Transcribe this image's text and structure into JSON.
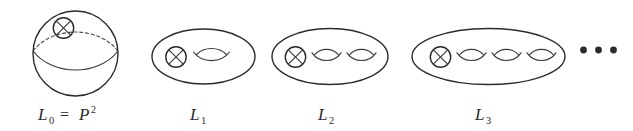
{
  "figure": {
    "kind": "mathematical-diagram",
    "background_color": "#ffffff",
    "ink_color": "#2b2b2b",
    "ellipsis": "• • •",
    "ellipsis_dot_count": 3,
    "surfaces": [
      {
        "id": "L0",
        "shape": "sphere",
        "label_main": "L",
        "label_subscript": "0",
        "label_equals": "=",
        "label_rhs_base": "P",
        "label_rhs_superscript": "2",
        "label_plain": "L₀ = P²",
        "crosscaps": 1,
        "handles": 0,
        "has_equator": true,
        "equator_back_style": "dashed",
        "equator_front_style": "solid"
      },
      {
        "id": "L1",
        "shape": "ellipse",
        "label_main": "L",
        "label_subscript": "1",
        "label_plain": "L₁",
        "crosscaps": 1,
        "handles": 1,
        "has_equator": false
      },
      {
        "id": "L2",
        "shape": "ellipse",
        "label_main": "L",
        "label_subscript": "2",
        "label_plain": "L₂",
        "crosscaps": 1,
        "handles": 2,
        "has_equator": false
      },
      {
        "id": "L3",
        "shape": "ellipse",
        "label_main": "L",
        "label_subscript": "3",
        "label_plain": "L₃",
        "crosscaps": 1,
        "handles": 3,
        "has_equator": false
      }
    ],
    "icon_names": {
      "crosscap": "crosscap-icon",
      "handle": "handle-icon",
      "ellipsis": "ellipsis-icon"
    }
  }
}
